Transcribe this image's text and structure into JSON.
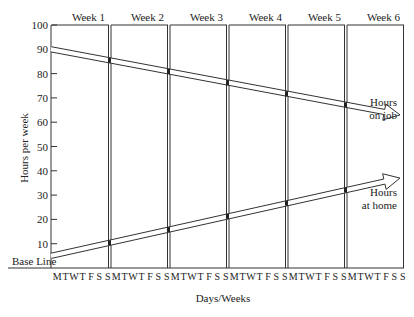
{
  "chart_data": {
    "type": "line",
    "title": "",
    "xlabel": "Days/Weeks",
    "ylabel": "Hours per week",
    "ylim": [
      0,
      100
    ],
    "yticks": [
      10,
      20,
      30,
      40,
      50,
      60,
      70,
      80,
      90,
      100
    ],
    "base_line_label": "Base Line",
    "weeks": [
      "Week 1",
      "Week 2",
      "Week 3",
      "Week 4",
      "Week 5",
      "Week 6"
    ],
    "day_labels": [
      "M",
      "T",
      "W",
      "T",
      "F",
      "S",
      "S"
    ],
    "grid": false,
    "x": [
      "Start",
      "End Week 1",
      "End Week 2",
      "End Week 3",
      "End Week 4",
      "End Week 5",
      "End Week 6"
    ],
    "series": [
      {
        "name": "Hours on job",
        "label_lines": [
          "Hours",
          "on job"
        ],
        "values": [
          90,
          85,
          80,
          75,
          70,
          65,
          63
        ],
        "style": "double-line arrow, decreasing"
      },
      {
        "name": "Hours at home",
        "label_lines": [
          "Hours",
          "at home"
        ],
        "values": [
          5,
          10,
          15,
          20,
          25,
          30,
          37
        ],
        "style": "double-line arrow, increasing"
      }
    ]
  }
}
